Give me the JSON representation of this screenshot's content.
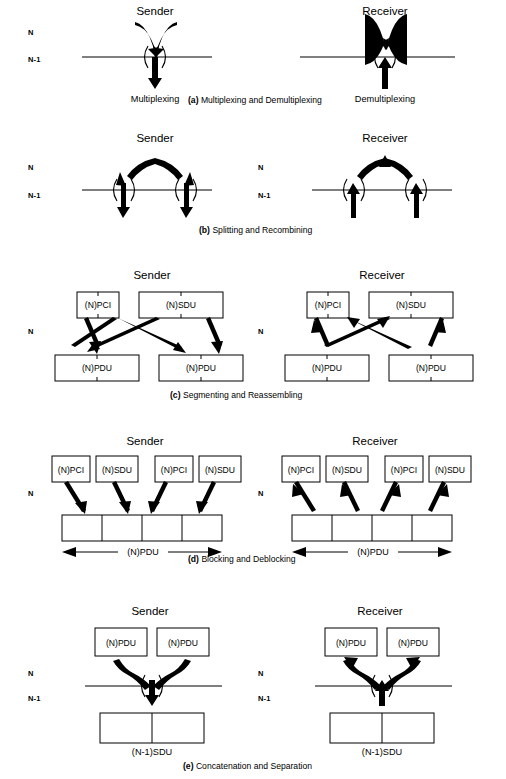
{
  "figure": {
    "layer_labels": {
      "upper": "N",
      "lower": "N-1"
    },
    "roles": {
      "sender": "Sender",
      "receiver": "Receiver"
    }
  },
  "panels": [
    {
      "id": "a",
      "caption_tag": "(a)",
      "caption_text": "Multiplexing and Demultiplexing",
      "sender": {
        "title": "Sender",
        "layers": [
          "N",
          "N-1"
        ],
        "op_label": "Multiplexing",
        "inputs": 2,
        "outputs": 1,
        "direction": "down"
      },
      "receiver": {
        "title": "Receiver",
        "layers": [
          "N",
          "N-1"
        ],
        "op_label": "Demultiplexing",
        "inputs": 1,
        "outputs": 2,
        "direction": "up"
      }
    },
    {
      "id": "b",
      "caption_tag": "(b)",
      "caption_text": "Splitting and Recombining",
      "sender": {
        "title": "Sender",
        "layers": [
          "N",
          "N-1"
        ],
        "op_label": "",
        "inputs": 1,
        "outputs": 2,
        "direction": "down"
      },
      "receiver": {
        "title": "Receiver",
        "layers": [
          "N",
          "N-1"
        ],
        "op_label": "",
        "inputs": 2,
        "outputs": 1,
        "direction": "up"
      }
    },
    {
      "id": "c",
      "caption_tag": "(c)",
      "caption_text": "Segmenting and Reassembling",
      "layer_label": "N",
      "sender": {
        "title": "Sender",
        "top_boxes": [
          "(N)PCI",
          "(N)SDU"
        ],
        "bottom_boxes": [
          "(N)PDU",
          "(N)PDU"
        ],
        "direction": "down"
      },
      "receiver": {
        "title": "Receiver",
        "top_boxes": [
          "(N)PCI",
          "(N)SDU"
        ],
        "bottom_boxes": [
          "(N)PDU",
          "(N)PDU"
        ],
        "direction": "up"
      }
    },
    {
      "id": "d",
      "caption_tag": "(d)",
      "caption_text": "Blocking and Deblocking",
      "layer_label": "N",
      "sender": {
        "title": "Sender",
        "top_boxes": [
          "(N)PCI",
          "(N)SDU",
          "(N)PCI",
          "(N)SDU"
        ],
        "strip_cells": 4,
        "dimension_label": "(N)PDU",
        "direction": "down"
      },
      "receiver": {
        "title": "Receiver",
        "top_boxes": [
          "(N)PCI",
          "(N)SDU",
          "(N)PCI",
          "(N)SDU"
        ],
        "strip_cells": 4,
        "dimension_label": "(N)PDU",
        "direction": "up"
      }
    },
    {
      "id": "e",
      "caption_tag": "(e)",
      "caption_text": "Concatenation and Separation",
      "sender": {
        "title": "Sender",
        "layers": [
          "N",
          "N-1"
        ],
        "top_boxes": [
          "(N)PDU",
          "(N)PDU"
        ],
        "bottom_label": "(N-1)SDU",
        "bottom_cells": 2,
        "direction": "down"
      },
      "receiver": {
        "title": "Receiver",
        "layers": [
          "N",
          "N-1"
        ],
        "top_boxes": [
          "(N)PDU",
          "(N)PDU"
        ],
        "bottom_label": "(N-1)SDU",
        "bottom_cells": 2,
        "direction": "up"
      }
    }
  ],
  "colors": {
    "ink": "#000000",
    "paper": "#ffffff"
  }
}
